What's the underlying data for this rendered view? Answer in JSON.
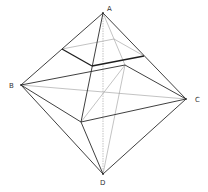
{
  "diagram": {
    "labels": {
      "A": "A",
      "B": "B",
      "C": "C",
      "D": "D"
    },
    "colors": {
      "edge": "#2a2a2a",
      "hidden": "#9a9a9a",
      "label": "#333333",
      "background": "#ffffff"
    }
  }
}
